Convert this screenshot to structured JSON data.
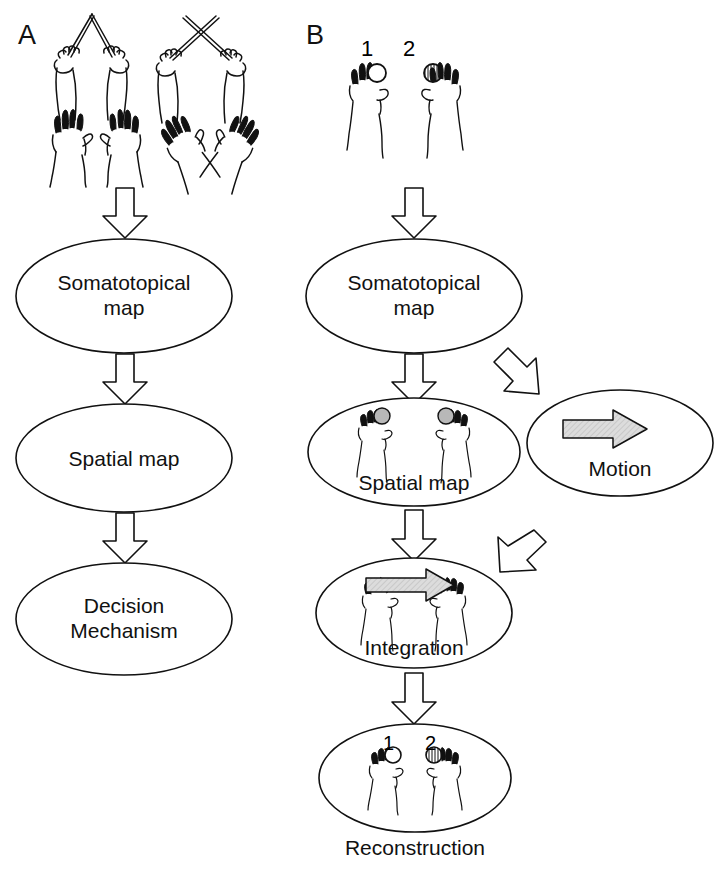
{
  "figure": {
    "type": "flow-diagram",
    "panels": [
      {
        "id": "A",
        "label": "A",
        "description": "Tactile temporal order judgement with uncrossed and crossed hands",
        "stimuli": [
          {
            "name": "uncrossed-sticks",
            "label": ""
          },
          {
            "name": "crossed-sticks",
            "label": ""
          },
          {
            "name": "uncrossed-hands",
            "label": ""
          },
          {
            "name": "crossed-hands",
            "label": ""
          }
        ],
        "nodes": [
          {
            "id": "a-somatotopical",
            "line1": "Somatotopical",
            "line2": "map"
          },
          {
            "id": "a-spatial",
            "line1": "Spatial map",
            "line2": ""
          },
          {
            "id": "a-decision",
            "line1": "Decision",
            "line2": "Mechanism"
          }
        ]
      },
      {
        "id": "B",
        "label": "B",
        "description": "Integration of somatotopic map with motion signal to reconstruct order",
        "stimulus": {
          "name": "two-hands-stimuli",
          "marker_first": "1",
          "marker_second": "2"
        },
        "nodes": [
          {
            "id": "b-somatotopical",
            "line1": "Somatotopical",
            "line2": "map"
          },
          {
            "id": "b-spatial",
            "line1": "Spatial map",
            "line2": ""
          },
          {
            "id": "b-motion",
            "line1": "Motion",
            "line2": ""
          },
          {
            "id": "b-integration",
            "line1": "Integration",
            "line2": ""
          },
          {
            "id": "b-reconstruction",
            "line1": "Reconstruction",
            "line2": ""
          }
        ],
        "reconstruction_markers": {
          "first": "1",
          "second": "2"
        }
      }
    ],
    "colors": {
      "stroke": "#111111",
      "background": "#ffffff",
      "gray_fill": "#b8b8b8",
      "arrow_fill": "#d0d0d0"
    }
  }
}
